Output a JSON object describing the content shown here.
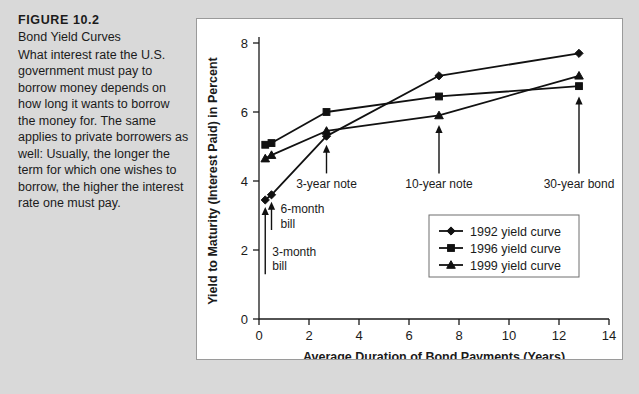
{
  "figure": {
    "number": "FIGURE 10.2",
    "subtitle": "Bond Yield Curves",
    "body": "What interest rate the U.S. government must pay to borrow money depends on how long it wants to borrow the money for. The same applies to private borrowers as well: Usually, the longer the term for which one wishes to borrow, the higher the interest rate one must pay."
  },
  "chart_data": {
    "type": "line",
    "title": "Bond Yield Curves",
    "xlabel": "Average Duration of Bond Payments (Years)",
    "ylabel": "Yield to Maturity (Interest Paid) in Percent",
    "xlim": [
      0,
      14
    ],
    "ylim": [
      0,
      8
    ],
    "xticks": [
      0,
      2,
      4,
      6,
      8,
      10,
      12,
      14
    ],
    "yticks": [
      0,
      2,
      4,
      6,
      8
    ],
    "xtick_labels": [
      "0",
      "2",
      "4",
      "6",
      "8",
      "10",
      "12",
      "14"
    ],
    "ytick_labels": [
      "0",
      "2",
      "4",
      "6",
      "8"
    ],
    "grid": false,
    "legend_position": "center-right",
    "x": [
      0.25,
      0.5,
      2.7,
      7.2,
      12.8
    ],
    "series": [
      {
        "name": "1992 yield curve",
        "marker": "diamond",
        "values": [
          3.45,
          3.6,
          5.3,
          7.05,
          7.7
        ]
      },
      {
        "name": "1996 yield curve",
        "marker": "square",
        "values": [
          5.05,
          5.1,
          6.0,
          6.45,
          6.75
        ]
      },
      {
        "name": "1999 yield curve",
        "marker": "triangle",
        "values": [
          4.65,
          4.75,
          5.45,
          5.9,
          7.05
        ]
      }
    ],
    "annotations": [
      {
        "label": "3-month bill",
        "x": 0.25,
        "text_line1": "3-month",
        "text_line2": "bill"
      },
      {
        "label": "6-month bill",
        "x": 0.5,
        "text_line1": "6-month",
        "text_line2": "bill"
      },
      {
        "label": "3-year note",
        "x": 2.7,
        "text_line1": "3-year note",
        "text_line2": ""
      },
      {
        "label": "10-year note",
        "x": 7.2,
        "text_line1": "10-year note",
        "text_line2": ""
      },
      {
        "label": "30-year bond",
        "x": 12.8,
        "text_line1": "30-year bond",
        "text_line2": ""
      }
    ],
    "colors": {
      "line": "#111111",
      "axis": "#1b1b1b",
      "panel_background": "#ffffff",
      "page_background": "#d9d9d9"
    }
  }
}
